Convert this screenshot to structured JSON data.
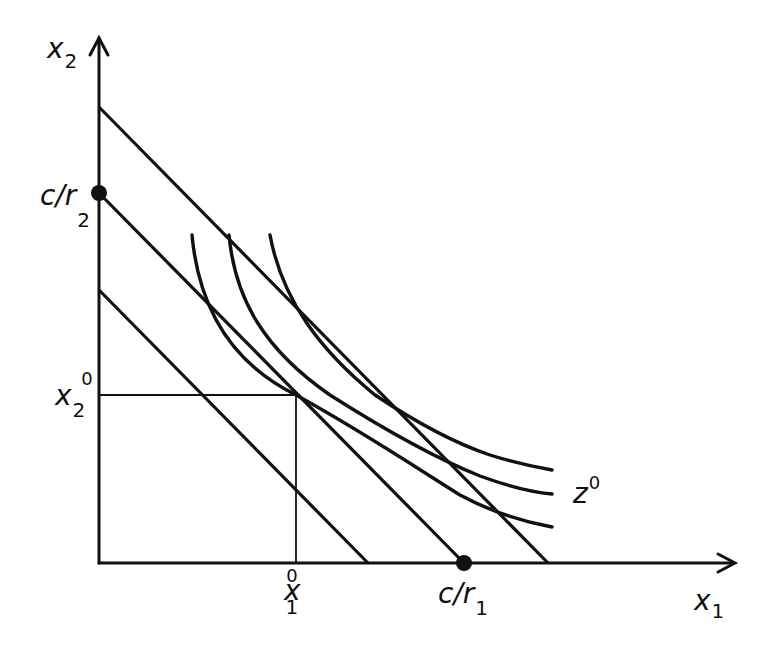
{
  "diagram": {
    "type": "economics-isoquant-isocost",
    "colors": {
      "ink": "#111111",
      "background": "#ffffff"
    },
    "axes": {
      "x_label": "x",
      "x_label_sub": "1",
      "y_label": "x",
      "y_label_sub": "2"
    },
    "intercepts": {
      "x_label": "c/r",
      "x_label_sub": "1",
      "y_label": "c/r",
      "y_label_sub": "2"
    },
    "optimum": {
      "x1_label": "x",
      "x1_sub": "1",
      "x1_sup": "0",
      "x2_label": "x",
      "x2_sub": "2",
      "x2_sup": "0"
    },
    "isoquant_label": {
      "text": "z",
      "sup": "0"
    },
    "isocost_lines": [
      {
        "name": "upper",
        "from": [
          99,
          107
        ],
        "to": [
          548,
          563
        ]
      },
      {
        "name": "middle",
        "from": [
          99,
          193
        ],
        "to": [
          464,
          563
        ]
      },
      {
        "name": "lower",
        "from": [
          99,
          290
        ],
        "to": [
          368,
          563
        ]
      }
    ],
    "isoquants": [
      {
        "name": "z0",
        "start": [
          192,
          235
        ],
        "end": [
          552,
          527
        ]
      },
      {
        "name": "middle",
        "start": [
          229,
          235
        ],
        "end": [
          552,
          494
        ]
      },
      {
        "name": "upper",
        "start": [
          270,
          235
        ],
        "end": [
          552,
          470
        ]
      }
    ]
  }
}
